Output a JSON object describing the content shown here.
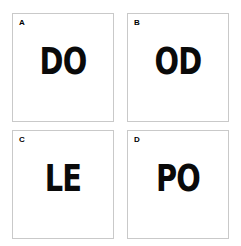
{
  "canvas": {
    "background": "#ffffff",
    "border_color": "#c9c9c9",
    "text_color": "#0a0a0a"
  },
  "panels": [
    {
      "label": "A",
      "word": "DO"
    },
    {
      "label": "B",
      "word": "OD"
    },
    {
      "label": "C",
      "word": "LE"
    },
    {
      "label": "D",
      "word": "PO"
    }
  ]
}
